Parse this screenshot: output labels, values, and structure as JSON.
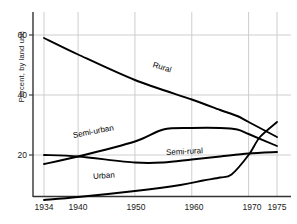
{
  "chart_data": {
    "type": "line",
    "title": "",
    "xlabel": "",
    "ylabel": "Percent, by land use",
    "xlim": [
      1934,
      1975
    ],
    "ylim": [
      4,
      64
    ],
    "xticks": [
      1934,
      1940,
      1950,
      1960,
      1970,
      1975
    ],
    "yticks": [
      20,
      40,
      60
    ],
    "grid": true,
    "legend_position": "inline-on-curve",
    "series": [
      {
        "name": "Rural",
        "label": "Rural",
        "x": [
          1934,
          1940,
          1950,
          1960,
          1965,
          1968,
          1970,
          1975
        ],
        "values": [
          59,
          53.5,
          45,
          38.5,
          35,
          33,
          31,
          26
        ]
      },
      {
        "name": "Semi-urban",
        "label": "Semi-urban",
        "x": [
          1934,
          1940,
          1950,
          1955,
          1960,
          1965,
          1968,
          1970,
          1975
        ],
        "values": [
          17,
          19.5,
          24.5,
          28.5,
          29,
          29,
          28.5,
          27,
          23
        ]
      },
      {
        "name": "Semi-rural",
        "label": "Semi-rural",
        "x": [
          1934,
          1940,
          1950,
          1955,
          1960,
          1965,
          1970,
          1975
        ],
        "values": [
          20,
          19.5,
          17.5,
          17.5,
          18.5,
          19.5,
          20.5,
          21
        ]
      },
      {
        "name": "Urban",
        "label": "Urban",
        "x": [
          1934,
          1940,
          1950,
          1958,
          1962,
          1965,
          1967,
          1970,
          1972,
          1975
        ],
        "values": [
          5,
          6,
          8,
          10,
          11.5,
          12.5,
          13.5,
          20,
          26,
          31
        ]
      }
    ]
  },
  "axis": {
    "ylabel_text": "Percent, by land use",
    "ytick_labels": [
      "60",
      "40",
      "20"
    ],
    "xtick_labels": [
      "1934",
      "1940",
      "1950",
      "1960",
      "1970",
      "1975"
    ]
  },
  "labels": {
    "rural": "Rural",
    "semi_urban": "Semi-urban",
    "semi_rural": "Semi-rural",
    "urban": "Urban"
  },
  "colors": {
    "line": "#000000",
    "grid": "#c8c8c8",
    "axis": "#333333",
    "background": "#ffffff",
    "text": "#1a1a1a"
  }
}
